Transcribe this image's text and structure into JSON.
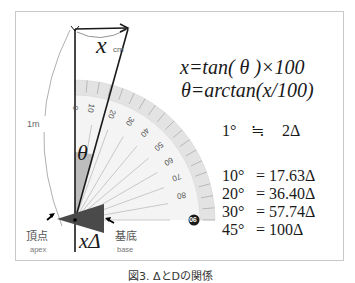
{
  "figure": {
    "caption": "図3. ΔとDの関係",
    "formulas": {
      "line1": "x=tan( θ )×100",
      "line2": "θ=arctan(x/100)"
    },
    "approximation": {
      "left": "1°",
      "symbol": "≒",
      "right": "2Δ"
    },
    "conversions": [
      {
        "angle": "10°",
        "value": "= 17.63Δ"
      },
      {
        "angle": "20°",
        "value": "= 36.40Δ"
      },
      {
        "angle": "30°",
        "value": "= 57.74Δ"
      },
      {
        "angle": "45°",
        "value": "= 100Δ"
      }
    ],
    "labels": {
      "x_cm_var": "x",
      "x_cm_unit": "cm",
      "length": "1m",
      "theta": "θ",
      "x_delta": "xΔ",
      "apex_jp": "頂点",
      "apex_en": "apex",
      "base_jp": "基底",
      "base_en": "base"
    },
    "protractor": {
      "ticks": [
        "0",
        "10",
        "20",
        "30",
        "40",
        "50",
        "60",
        "70",
        "80",
        "90"
      ]
    },
    "colors": {
      "line": "#1a1a1a",
      "prism": "#4a4a4a",
      "theta_sector": "#bdbdbd",
      "protractor_band": "#e3e3e3",
      "frame_border": "#c9c9c9"
    }
  }
}
